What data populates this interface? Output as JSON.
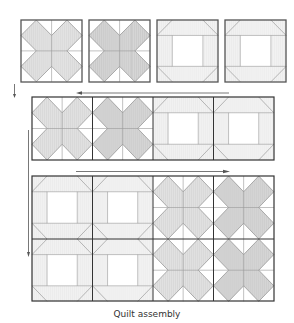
{
  "caption": "Quilt assembly",
  "colors": {
    "outline": "#555555",
    "seam": "#9a9a9a",
    "fill_x": "#dcdcdc",
    "fill_x_dark": "#cfcfcf",
    "fill_frame": "#efefef",
    "background": "#ffffff"
  },
  "blocks": {
    "types": [
      "x-block",
      "frame-block"
    ]
  },
  "rows": [
    {
      "label": "row-1-separate-blocks",
      "blocks": [
        "x-block",
        "x-block",
        "frame-block",
        "frame-block"
      ]
    },
    {
      "label": "row-2-joined-strip",
      "blocks": [
        "x-block",
        "x-block",
        "frame-block",
        "frame-block"
      ]
    },
    {
      "label": "row-3-joined-grid-top",
      "blocks": [
        "frame-block",
        "frame-block",
        "x-block",
        "x-block"
      ]
    },
    {
      "label": "row-3-joined-grid-bottom",
      "blocks": [
        "frame-block",
        "frame-block",
        "x-block",
        "x-block"
      ]
    }
  ],
  "arrows": [
    {
      "name": "arrow-down-short",
      "direction": "down"
    },
    {
      "name": "arrow-left",
      "direction": "left"
    },
    {
      "name": "arrow-right",
      "direction": "right"
    },
    {
      "name": "arrow-down-long",
      "direction": "down"
    }
  ]
}
